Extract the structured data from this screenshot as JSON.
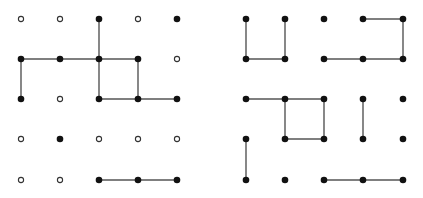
{
  "colors": {
    "line": "#555555",
    "filled": "#111111",
    "hollow_stroke": "#333333",
    "background": "#ffffff"
  },
  "grid": {
    "rows": 5,
    "cols": 5
  },
  "panels": [
    {
      "name": "left-grid",
      "xs": [
        21,
        60,
        99,
        138,
        177
      ],
      "ys": [
        19,
        59,
        99,
        139,
        180
      ],
      "dots": [
        [
          "o",
          "o",
          "f",
          "o",
          "f"
        ],
        [
          "f",
          "f",
          "f",
          "f",
          "o"
        ],
        [
          "f",
          "o",
          "f",
          "f",
          "f"
        ],
        [
          "o",
          "f",
          "o",
          "o",
          "o"
        ],
        [
          "o",
          "o",
          "f",
          "f",
          "f"
        ]
      ],
      "edges": [
        [
          [
            0,
            2
          ],
          [
            1,
            2
          ]
        ],
        [
          [
            1,
            0
          ],
          [
            1,
            1
          ]
        ],
        [
          [
            1,
            1
          ],
          [
            1,
            2
          ]
        ],
        [
          [
            1,
            2
          ],
          [
            1,
            3
          ]
        ],
        [
          [
            1,
            0
          ],
          [
            2,
            0
          ]
        ],
        [
          [
            1,
            2
          ],
          [
            2,
            2
          ]
        ],
        [
          [
            1,
            3
          ],
          [
            2,
            3
          ]
        ],
        [
          [
            2,
            2
          ],
          [
            2,
            3
          ]
        ],
        [
          [
            2,
            3
          ],
          [
            2,
            4
          ]
        ],
        [
          [
            4,
            2
          ],
          [
            4,
            3
          ]
        ],
        [
          [
            4,
            3
          ],
          [
            4,
            4
          ]
        ]
      ]
    },
    {
      "name": "right-grid",
      "xs": [
        246,
        285,
        324,
        363,
        403
      ],
      "ys": [
        19,
        59,
        99,
        139,
        180
      ],
      "dots": [
        [
          "f",
          "f",
          "f",
          "f",
          "f"
        ],
        [
          "f",
          "f",
          "f",
          "f",
          "f"
        ],
        [
          "f",
          "f",
          "f",
          "f",
          "f"
        ],
        [
          "f",
          "f",
          "f",
          "f",
          "f"
        ],
        [
          "f",
          "f",
          "f",
          "f",
          "f"
        ]
      ],
      "edges": [
        [
          [
            0,
            0
          ],
          [
            1,
            0
          ]
        ],
        [
          [
            0,
            1
          ],
          [
            1,
            1
          ]
        ],
        [
          [
            1,
            0
          ],
          [
            1,
            1
          ]
        ],
        [
          [
            0,
            3
          ],
          [
            0,
            4
          ]
        ],
        [
          [
            0,
            4
          ],
          [
            1,
            4
          ]
        ],
        [
          [
            1,
            2
          ],
          [
            1,
            3
          ]
        ],
        [
          [
            1,
            3
          ],
          [
            1,
            4
          ]
        ],
        [
          [
            2,
            0
          ],
          [
            2,
            1
          ]
        ],
        [
          [
            2,
            1
          ],
          [
            2,
            2
          ]
        ],
        [
          [
            2,
            1
          ],
          [
            3,
            1
          ]
        ],
        [
          [
            2,
            2
          ],
          [
            3,
            2
          ]
        ],
        [
          [
            3,
            1
          ],
          [
            3,
            2
          ]
        ],
        [
          [
            2,
            3
          ],
          [
            3,
            3
          ]
        ],
        [
          [
            3,
            0
          ],
          [
            4,
            0
          ]
        ],
        [
          [
            4,
            2
          ],
          [
            4,
            3
          ]
        ],
        [
          [
            4,
            3
          ],
          [
            4,
            4
          ]
        ]
      ]
    }
  ]
}
